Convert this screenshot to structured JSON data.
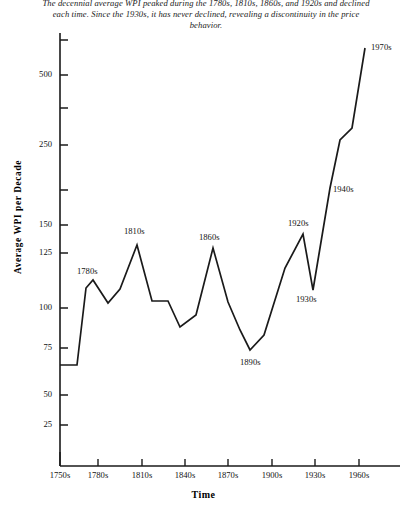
{
  "caption": "The decennial average WPI peaked during the 1780s, 1810s, 1860s, and 1920s and declined each time. Since the 1930s, it has never declined, revealing a discontinuity in the price behavior.",
  "axes": {
    "y_title": "Average WPI per Decade",
    "x_title": "Time"
  },
  "chart_data": {
    "type": "line",
    "title": "",
    "subtitle": "",
    "xlabel": "Time",
    "ylabel": "Average WPI per Decade",
    "yscale": "log",
    "grid": false,
    "legend": "none",
    "line_color": "#1a1a1a",
    "y_ticks": [
      25,
      50,
      75,
      100,
      125,
      150,
      250,
      500
    ],
    "y_tick_labels": [
      "25",
      "50",
      "75",
      "100",
      "125",
      "150",
      "250",
      "500"
    ],
    "y_unlabeled_ticks": [
      190,
      350,
      700
    ],
    "ylim": [
      20,
      700
    ],
    "x_ticks": [
      "1750s",
      "1780s",
      "1810s",
      "1840s",
      "1870s",
      "1900s",
      "1930s",
      "1960s"
    ],
    "x": [
      "1750s",
      "1760s",
      "1770s",
      "1780s",
      "1790s",
      "1800s",
      "1810s",
      "1820s",
      "1830s",
      "1840s",
      "1850s",
      "1860s",
      "1870s",
      "1880s",
      "1890s",
      "1900s",
      "1910s",
      "1920s",
      "1930s",
      "1940s",
      "1950s",
      "1960s",
      "1970s"
    ],
    "values": [
      65,
      65,
      112,
      120,
      103,
      122,
      145,
      101,
      101,
      84,
      96,
      148,
      104,
      88,
      75,
      86,
      117,
      141,
      102,
      200,
      290,
      345,
      560
    ],
    "annotations": [
      {
        "label": "1780s",
        "x": "1780s",
        "value": 120
      },
      {
        "label": "1810s",
        "x": "1810s",
        "value": 145
      },
      {
        "label": "1860s",
        "x": "1860s",
        "value": 148
      },
      {
        "label": "1890s",
        "x": "1890s",
        "value": 75
      },
      {
        "label": "1920s",
        "x": "1920s",
        "value": 141
      },
      {
        "label": "1930s",
        "x": "1930s",
        "value": 102
      },
      {
        "label": "1940s",
        "x": "1940s",
        "value": 200
      },
      {
        "label": "1970s",
        "x": "1970s",
        "value": 560
      }
    ]
  },
  "ticks_px": {
    "y": [
      {
        "label": "500",
        "y": 75
      },
      {
        "label": "250",
        "y": 145
      },
      {
        "label": "150",
        "y": 225
      },
      {
        "label": "125",
        "y": 253
      },
      {
        "label": "100",
        "y": 308
      },
      {
        "label": "75",
        "y": 348
      },
      {
        "label": "50",
        "y": 395
      },
      {
        "label": "25",
        "y": 425
      }
    ],
    "y_unlabeled": [
      40,
      108,
      190
    ],
    "x": [
      {
        "label": "1750s",
        "x": 60
      },
      {
        "label": "1780s",
        "x": 98
      },
      {
        "label": "1810s",
        "x": 142
      },
      {
        "label": "1840s",
        "x": 185
      },
      {
        "label": "1870s",
        "x": 228
      },
      {
        "label": "1900s",
        "x": 272
      },
      {
        "label": "1930s",
        "x": 315
      },
      {
        "label": "1960s",
        "x": 359
      }
    ]
  },
  "series_px": {
    "points": [
      [
        60,
        365
      ],
      [
        77,
        365
      ],
      [
        86,
        288
      ],
      [
        93,
        280
      ],
      [
        108,
        303
      ],
      [
        120,
        289
      ],
      [
        137,
        245
      ],
      [
        152,
        301
      ],
      [
        168,
        301
      ],
      [
        180,
        327
      ],
      [
        196,
        315
      ],
      [
        213,
        248
      ],
      [
        228,
        302
      ],
      [
        240,
        330
      ],
      [
        250,
        350
      ],
      [
        264,
        335
      ],
      [
        285,
        268
      ],
      [
        303,
        234
      ],
      [
        313,
        290
      ],
      [
        330,
        188
      ],
      [
        340,
        140
      ],
      [
        352,
        128
      ],
      [
        365,
        48
      ]
    ]
  },
  "annotations_px": [
    {
      "label": "1780s",
      "x": 77,
      "y": 266
    },
    {
      "label": "1810s",
      "x": 124,
      "y": 226
    },
    {
      "label": "1860s",
      "x": 199,
      "y": 232
    },
    {
      "label": "1890s",
      "x": 240,
      "y": 357
    },
    {
      "label": "1920s",
      "x": 288,
      "y": 218
    },
    {
      "label": "1930s",
      "x": 296,
      "y": 294
    },
    {
      "label": "1940s",
      "x": 333,
      "y": 184
    },
    {
      "label": "1970s",
      "x": 371,
      "y": 42
    }
  ]
}
